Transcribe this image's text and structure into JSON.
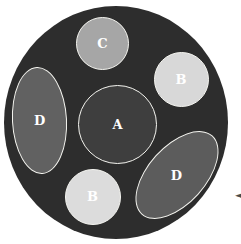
{
  "figure": {
    "background_color": "#ffffff",
    "outer_circle_color": "#2d2d2d",
    "outline_color": "#f5f5f0",
    "label_color": "#ffffff",
    "shapes": [
      {
        "label": "A",
        "kind": "circle",
        "position": "center",
        "fill": "#3e3e3e"
      },
      {
        "label": "C",
        "kind": "circle",
        "position": "top",
        "fill": "#a6a6a6"
      },
      {
        "label": "B",
        "kind": "circle",
        "position": "top-right",
        "fill": "#d8d8d8"
      },
      {
        "label": "B",
        "kind": "circle",
        "position": "bottom",
        "fill": "#dcdcdc"
      },
      {
        "label": "D",
        "kind": "ellipse",
        "position": "left",
        "fill": "#616161"
      },
      {
        "label": "D",
        "kind": "ellipse",
        "position": "bottom-right",
        "fill": "#5c5c5c"
      }
    ],
    "pointer": {
      "glyph": "◄",
      "color": "#4a4a4a"
    }
  }
}
